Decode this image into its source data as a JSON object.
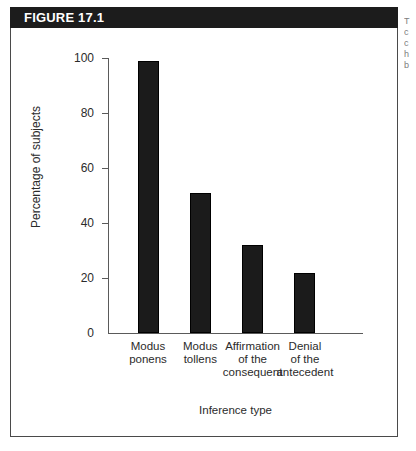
{
  "figure": {
    "header_label": "FIGURE 17.1",
    "header_bg": "#1c1c1c",
    "header_text_color": "#ffffff",
    "border_color": "#4a4a4a"
  },
  "margin_note": {
    "line1": "T",
    "line2": "c",
    "line3": "c",
    "line4": "h",
    "line5": "b"
  },
  "chart_data": {
    "type": "bar",
    "title": "",
    "subtitle": "",
    "xlabel": "Inference type",
    "ylabel": "Percentage of subjects",
    "categories": [
      "Modus ponens",
      "Modus tollens",
      "Affirmation of the consequent",
      "Denial of the antecedent"
    ],
    "category_lines": [
      [
        "Modus",
        "ponens"
      ],
      [
        "Modus",
        "tollens"
      ],
      [
        "Affirmation",
        "of the",
        "consequent"
      ],
      [
        "Denial",
        "of the",
        "antecedent"
      ]
    ],
    "values": [
      99,
      51,
      32,
      22
    ],
    "ylim": [
      0,
      100
    ],
    "yticks": [
      0,
      20,
      40,
      60,
      80,
      100
    ],
    "ytick_labels": [
      "0",
      "20",
      "40",
      "60",
      "80",
      "100"
    ],
    "grid": false,
    "legend": false,
    "bar_color": "#1b1b1b"
  }
}
